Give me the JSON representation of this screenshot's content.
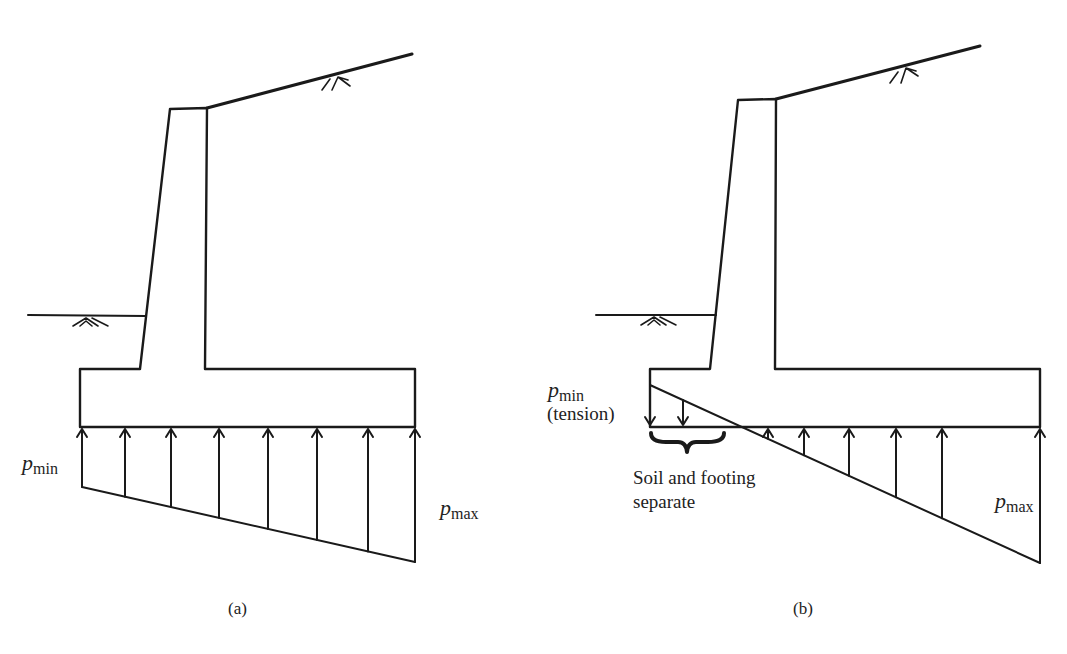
{
  "figure": {
    "panels": [
      {
        "id": "a",
        "caption": "(a)",
        "pmin": {
          "symbol": "p",
          "sub": "min"
        },
        "pmax": {
          "symbol": "p",
          "sub": "max"
        },
        "pressure_state": "full-contact trapezoidal",
        "arrow_count": 8
      },
      {
        "id": "b",
        "caption": "(b)",
        "pmin": {
          "symbol": "p",
          "sub": "min",
          "note": "(tension)"
        },
        "pmax": {
          "symbol": "p",
          "sub": "max"
        },
        "separation_note_line1": "Soil and footing",
        "separation_note_line2": "separate",
        "pressure_state": "partial contact with tension zone",
        "tension_arrow_count": 2,
        "compression_arrow_count": 6
      }
    ]
  }
}
